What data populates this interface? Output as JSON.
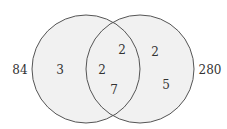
{
  "diagram": {
    "type": "venn",
    "colors": {
      "fill": "#f1f1f1",
      "stroke": "#555555",
      "text": "#333333"
    },
    "circles": [
      {
        "name": "left",
        "outside_label": "84"
      },
      {
        "name": "right",
        "outside_label": "280"
      }
    ],
    "regions": {
      "left_only": "3",
      "intersection_left": "2",
      "intersection_top": "2",
      "intersection_bottom": "7",
      "right_only_top": "2",
      "right_only_bottom": "5"
    }
  }
}
